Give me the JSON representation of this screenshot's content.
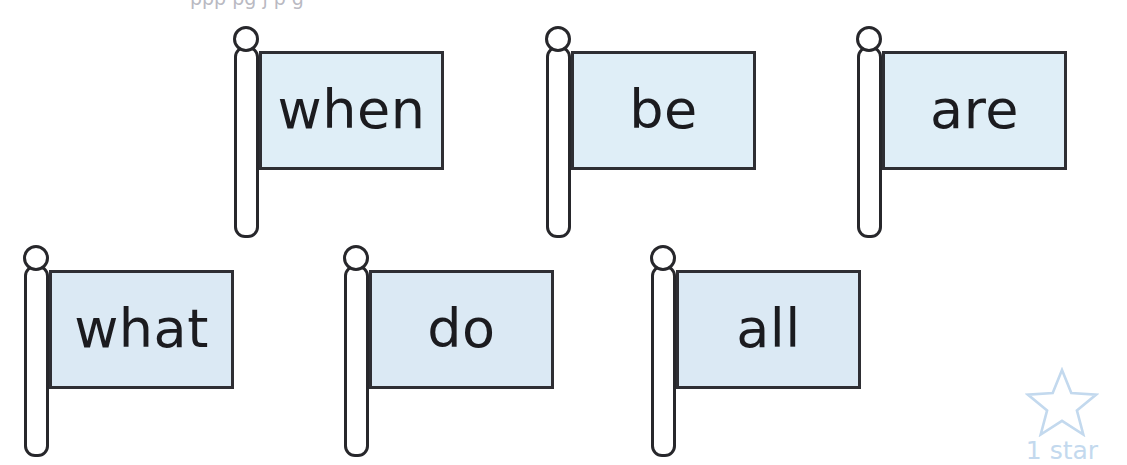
{
  "page": {
    "background_color": "#ffffff",
    "top_clipped_text_fragments": "ppp  pg  j      p      g",
    "flag_outline_color": "#27272b",
    "pole_fill_color": "#ffffff"
  },
  "flags": [
    {
      "word": "when",
      "row": 1,
      "banner_fill": "#dfeef7",
      "group_left": 228,
      "group_top": 26,
      "finial_size": 26,
      "finial_left": 5,
      "pole_left": 6,
      "pole_top": 20,
      "pole_width": 25,
      "pole_height": 192,
      "banner_left": 31,
      "banner_top": 25,
      "banner_width": 185,
      "banner_height": 119
    },
    {
      "word": "be",
      "row": 1,
      "banner_fill": "#dfeef7",
      "group_left": 540,
      "group_top": 26,
      "finial_size": 26,
      "finial_left": 5,
      "pole_left": 6,
      "pole_top": 20,
      "pole_width": 25,
      "pole_height": 192,
      "banner_left": 31,
      "banner_top": 25,
      "banner_width": 185,
      "banner_height": 119
    },
    {
      "word": "are",
      "row": 1,
      "banner_fill": "#dfeef7",
      "group_left": 851,
      "group_top": 26,
      "finial_size": 26,
      "finial_left": 5,
      "pole_left": 6,
      "pole_top": 20,
      "pole_width": 25,
      "pole_height": 192,
      "banner_left": 31,
      "banner_top": 25,
      "banner_width": 185,
      "banner_height": 119
    },
    {
      "word": "what",
      "row": 2,
      "banner_fill": "#dbe9f4",
      "group_left": 18,
      "group_top": 245,
      "finial_size": 26,
      "finial_left": 5,
      "pole_left": 6,
      "pole_top": 20,
      "pole_width": 25,
      "pole_height": 192,
      "banner_left": 31,
      "banner_top": 25,
      "banner_width": 185,
      "banner_height": 119
    },
    {
      "word": "do",
      "row": 2,
      "banner_fill": "#dbe9f4",
      "group_left": 338,
      "group_top": 245,
      "finial_size": 26,
      "finial_left": 5,
      "pole_left": 6,
      "pole_top": 20,
      "pole_width": 25,
      "pole_height": 192,
      "banner_left": 31,
      "banner_top": 25,
      "banner_width": 185,
      "banner_height": 119
    },
    {
      "word": "all",
      "row": 2,
      "banner_fill": "#dbe9f4",
      "group_left": 645,
      "group_top": 245,
      "finial_size": 26,
      "finial_left": 5,
      "pole_left": 6,
      "pole_top": 20,
      "pole_width": 25,
      "pole_height": 192,
      "banner_left": 31,
      "banner_top": 25,
      "banner_width": 185,
      "banner_height": 119
    }
  ],
  "star_rating": {
    "label": "1 star",
    "count": 1,
    "stroke_color": "#c3d9ee",
    "text_color": "#c3d9ee"
  }
}
